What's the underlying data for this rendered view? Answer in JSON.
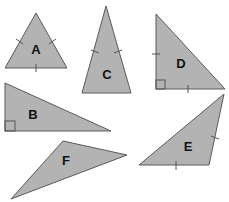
{
  "diagram": {
    "title": "",
    "fill_color": "#b3b3b3",
    "stroke_color": "#5a5a5a",
    "triangles": [
      {
        "label": "A",
        "type": "equilateral",
        "points": "36,13 5,68 67,68",
        "label_pos": [
          36,
          49
        ],
        "ticks": 3,
        "right_angle": false
      },
      {
        "label": "B",
        "type": "right scalene",
        "points": "5,83 5,131 111,131",
        "label_pos": [
          33,
          114
        ],
        "ticks": 0,
        "right_angle": true
      },
      {
        "label": "C",
        "type": "isosceles",
        "points": "106,6 82,93 131,93",
        "label_pos": [
          107,
          74
        ],
        "ticks": 2,
        "right_angle": false
      },
      {
        "label": "D",
        "type": "right isosceles",
        "points": "156,14 156,89 225,89",
        "label_pos": [
          181,
          63
        ],
        "ticks": 2,
        "right_angle": true
      },
      {
        "label": "E",
        "type": "isosceles obtuse",
        "points": "224,94 209,165 139,165",
        "label_pos": [
          188,
          146
        ],
        "ticks": 2,
        "right_angle": false
      },
      {
        "label": "F",
        "type": "scalene obtuse",
        "points": "63,141 127,155 11,199",
        "label_pos": [
          66,
          160
        ],
        "ticks": 0,
        "right_angle": false
      }
    ]
  }
}
